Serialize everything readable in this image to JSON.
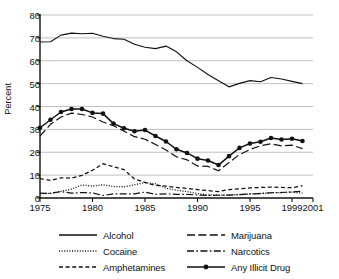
{
  "chart_data": {
    "type": "line",
    "title": "",
    "xlabel": "",
    "ylabel": "Percent",
    "xlim": [
      1975,
      2001
    ],
    "ylim": [
      0,
      80
    ],
    "ytick_values": [
      0,
      10,
      20,
      30,
      40,
      50,
      60,
      70,
      80
    ],
    "ytick_labels": [
      "0",
      "10",
      "20",
      "30",
      "40",
      "50",
      "60",
      "70",
      "80"
    ],
    "xtick_values": [
      1975,
      1980,
      1985,
      1990,
      1995,
      1999,
      2001
    ],
    "xtick_labels": [
      "1975",
      "1980",
      "1985",
      "1990",
      "1995",
      "1999",
      "2001"
    ],
    "grid": "horizontal",
    "legend_position": "bottom",
    "x": [
      1975,
      1976,
      1977,
      1978,
      1979,
      1980,
      1981,
      1982,
      1983,
      1984,
      1985,
      1986,
      1987,
      1988,
      1989,
      1990,
      1991,
      1992,
      1993,
      1994,
      1995,
      1996,
      1997,
      1998,
      1999,
      2000
    ],
    "series": [
      {
        "name": "Alcohol",
        "style": "solid",
        "markers": false,
        "values": [
          68.2,
          68.3,
          71.2,
          72.1,
          71.8,
          72.0,
          70.7,
          69.7,
          69.4,
          67.2,
          65.9,
          65.3,
          66.4,
          63.9,
          60.0,
          57.1,
          54.0,
          51.3,
          48.6,
          50.1,
          51.3,
          50.8,
          52.7,
          52.0,
          51.0,
          50.0
        ]
      },
      {
        "name": "Marijuana",
        "style": "dashed-long",
        "markers": false,
        "values": [
          27.1,
          32.2,
          35.4,
          37.1,
          36.5,
          35.4,
          33.2,
          31.6,
          29.2,
          26.8,
          25.7,
          23.4,
          21.0,
          18.0,
          16.7,
          14.0,
          13.8,
          11.9,
          15.5,
          19.0,
          21.2,
          22.8,
          23.7,
          22.8,
          23.1,
          21.6
        ]
      },
      {
        "name": "Cocaine",
        "style": "dotted",
        "markers": false,
        "values": [
          1.9,
          2.0,
          2.9,
          3.9,
          5.7,
          5.2,
          5.8,
          5.0,
          4.9,
          5.8,
          6.7,
          6.2,
          4.3,
          3.4,
          2.8,
          1.9,
          1.4,
          1.3,
          1.3,
          1.5,
          1.8,
          2.0,
          2.3,
          2.4,
          2.6,
          2.1
        ]
      },
      {
        "name": "Narcotics",
        "style": "dash-dot",
        "markers": false,
        "values": [
          2.1,
          2.0,
          2.8,
          2.1,
          2.4,
          2.2,
          1.1,
          1.8,
          1.8,
          1.8,
          2.6,
          1.6,
          1.8,
          1.6,
          1.6,
          1.3,
          1.1,
          1.2,
          1.3,
          1.5,
          1.8,
          1.9,
          2.3,
          2.4,
          2.6,
          3.0
        ]
      },
      {
        "name": "Amphetamines",
        "style": "dashed-short",
        "markers": false,
        "values": [
          8.5,
          7.7,
          8.8,
          8.7,
          9.9,
          12.1,
          15.0,
          13.7,
          12.4,
          8.3,
          6.8,
          5.5,
          5.2,
          4.6,
          4.2,
          3.7,
          3.2,
          2.8,
          3.7,
          4.0,
          4.4,
          4.6,
          4.8,
          4.6,
          4.5,
          5.4
        ]
      },
      {
        "name": "Any Illicit Drug",
        "style": "solid-markers",
        "markers": true,
        "values": [
          30.7,
          34.2,
          37.6,
          38.9,
          38.9,
          37.2,
          36.9,
          32.5,
          30.5,
          29.2,
          29.7,
          27.1,
          24.7,
          21.3,
          19.7,
          17.2,
          16.4,
          14.4,
          18.3,
          21.9,
          23.8,
          24.6,
          26.2,
          25.6,
          25.9,
          24.9
        ]
      }
    ]
  }
}
